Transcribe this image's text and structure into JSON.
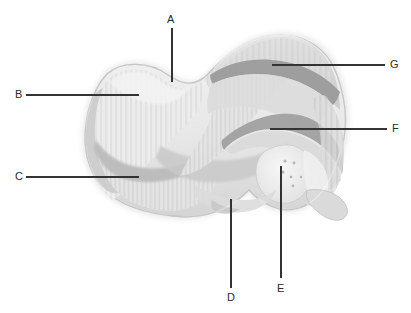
{
  "figure": {
    "title_fragment": "",
    "background_color": "#ffffff",
    "line_color": "#333333",
    "label_color": "#2b2b2b",
    "bone_fill_light": "#ededed",
    "bone_fill_mid": "#d9d9d9",
    "bone_fill_shadow": "#c2c2c2",
    "bone_outline": "#9a9a9a",
    "ridge_color": "#8e8e8e"
  },
  "labels": [
    {
      "id": "A",
      "text": "A",
      "text_x": 167,
      "text_y": 19,
      "line": {
        "x1": 172,
        "y1": 28,
        "x2": 172,
        "y2": 82
      },
      "orientation": "vertical-top"
    },
    {
      "id": "B",
      "text": "B",
      "text_x": 15,
      "text_y": 90,
      "line": {
        "x1": 26,
        "y1": 95,
        "x2": 139,
        "y2": 95
      },
      "orientation": "horizontal-left"
    },
    {
      "id": "C",
      "text": "C",
      "text_x": 15,
      "text_y": 172,
      "line": {
        "x1": 26,
        "y1": 177,
        "x2": 139,
        "y2": 177
      },
      "orientation": "horizontal-left"
    },
    {
      "id": "D",
      "text": "D",
      "text_x": 227,
      "text_y": 297,
      "line": {
        "x1": 231,
        "y1": 199,
        "x2": 231,
        "y2": 288
      },
      "orientation": "vertical-bottom"
    },
    {
      "id": "E",
      "text": "E",
      "text_x": 277,
      "text_y": 288,
      "line": {
        "x1": 281,
        "y1": 166,
        "x2": 281,
        "y2": 278
      },
      "orientation": "vertical-bottom"
    },
    {
      "id": "F",
      "text": "F",
      "text_x": 392,
      "text_y": 124,
      "line": {
        "x1": 270,
        "y1": 129,
        "x2": 387,
        "y2": 129
      },
      "orientation": "horizontal-right"
    },
    {
      "id": "G",
      "text": "G",
      "text_x": 390,
      "text_y": 60,
      "line": {
        "x1": 272,
        "y1": 65,
        "x2": 385,
        "y2": 65
      },
      "orientation": "horizontal-right"
    }
  ]
}
